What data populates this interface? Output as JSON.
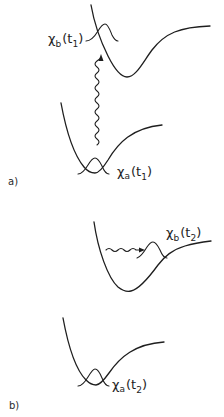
{
  "figure": {
    "panels": [
      {
        "id": "a",
        "label": "a)",
        "upper_wavepacket": {
          "symbol": "χ",
          "subscript": "b",
          "arg_open": "(t",
          "arg_sub": "1",
          "arg_close": ")"
        },
        "lower_wavepacket": {
          "symbol": "χ",
          "subscript": "a",
          "arg_open": "(t",
          "arg_sub": "1",
          "arg_close": ")"
        },
        "transition": "vertical wavy arrow (photon excitation) from lower to upper potential"
      },
      {
        "id": "b",
        "label": "b)",
        "upper_wavepacket": {
          "symbol": "χ",
          "subscript": "b",
          "arg_open": "(t",
          "arg_sub": "2",
          "arg_close": ")"
        },
        "lower_wavepacket": {
          "symbol": "χ",
          "subscript": "a",
          "arg_open": "(t",
          "arg_sub": "2",
          "arg_close": ")"
        },
        "transition": "horizontal wavy arrow showing wavepacket motion on upper potential"
      }
    ],
    "colors": {
      "ink": "#1e1e1e",
      "background": "#ffffff"
    }
  }
}
